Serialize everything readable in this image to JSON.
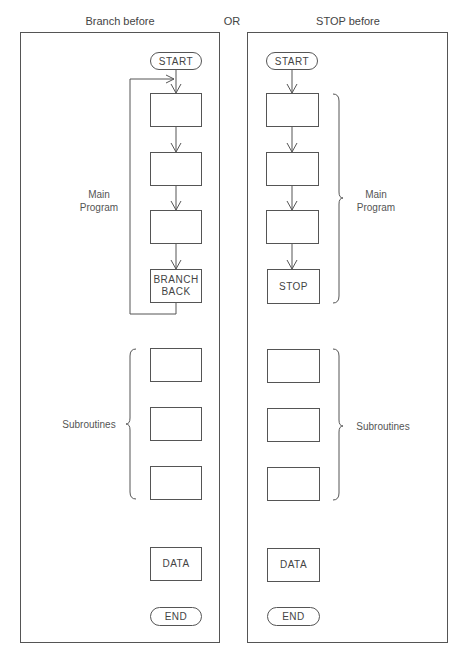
{
  "headers": {
    "left": "Branch before",
    "middle": "OR",
    "right": "STOP before"
  },
  "left_panel": {
    "start": "START",
    "main_label_line1": "Main",
    "main_label_line2": "Program",
    "main_boxes": [
      "",
      "",
      "",
      "BRANCH\nBACK"
    ],
    "branch_line1": "BRANCH",
    "branch_line2": "BACK",
    "subroutines_label": "Subroutines",
    "subroutine_boxes": [
      "",
      "",
      ""
    ],
    "data": "DATA",
    "end": "END"
  },
  "right_panel": {
    "start": "START",
    "main_label_line1": "Main",
    "main_label_line2": "Program",
    "stop": "STOP",
    "subroutines_label": "Subroutines",
    "subroutine_boxes": [
      "",
      "",
      ""
    ],
    "data": "DATA",
    "end": "END"
  },
  "colors": {
    "line": "#555555",
    "text": "#444444",
    "background": "#ffffff"
  }
}
